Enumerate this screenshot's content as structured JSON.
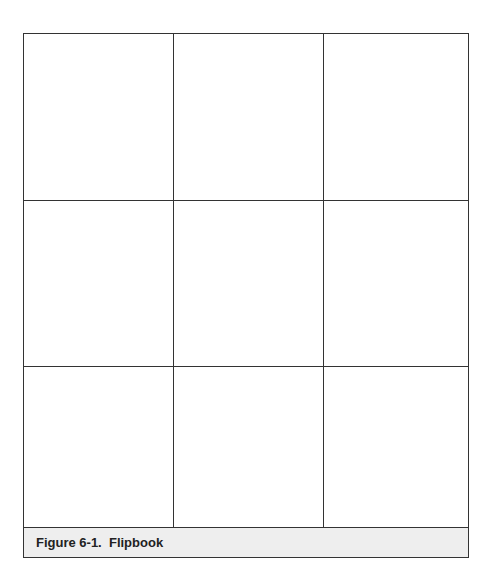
{
  "figure": {
    "caption": "Figure 6-1.  Flipbook",
    "grid": {
      "rows": 3,
      "columns": 3,
      "cells": [
        {
          "row": 1,
          "col": 1,
          "content": ""
        },
        {
          "row": 1,
          "col": 2,
          "content": ""
        },
        {
          "row": 1,
          "col": 3,
          "content": ""
        },
        {
          "row": 2,
          "col": 1,
          "content": ""
        },
        {
          "row": 2,
          "col": 2,
          "content": ""
        },
        {
          "row": 2,
          "col": 3,
          "content": ""
        },
        {
          "row": 3,
          "col": 1,
          "content": ""
        },
        {
          "row": 3,
          "col": 2,
          "content": ""
        },
        {
          "row": 3,
          "col": 3,
          "content": ""
        }
      ]
    },
    "colors": {
      "border": "#333333",
      "caption_background": "#eeeeee",
      "caption_text": "#222222"
    }
  }
}
